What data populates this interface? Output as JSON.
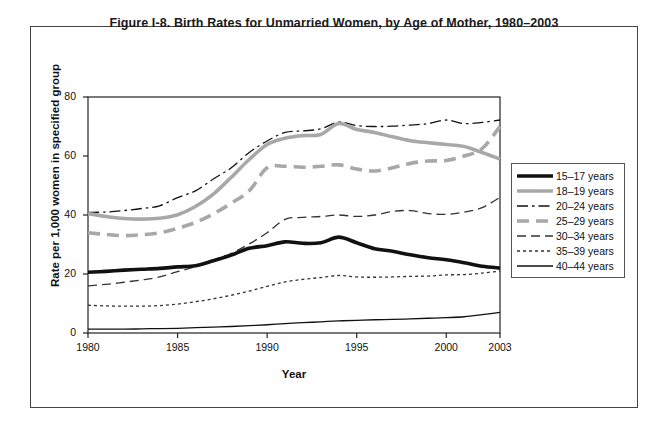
{
  "figure": {
    "title": "Figure I-8. Birth Rates for Unmarried Women, by Age of Mother, 1980–2003"
  },
  "chart_data": {
    "type": "line",
    "title": "Figure I-8. Birth Rates for Unmarried Women, by Age of Mother, 1980–2003",
    "xlabel": "Year",
    "ylabel": "Rate per 1,000 women in specified group",
    "xlim": [
      1980,
      2003
    ],
    "ylim": [
      0,
      80
    ],
    "yticks": [
      0,
      20,
      40,
      60,
      80
    ],
    "xticks": [
      1980,
      1985,
      1990,
      1995,
      2000,
      2003
    ],
    "grid": false,
    "legend_position": "right-outside",
    "x": [
      1980,
      1981,
      1982,
      1983,
      1984,
      1985,
      1986,
      1987,
      1988,
      1989,
      1990,
      1991,
      1992,
      1993,
      1994,
      1995,
      1996,
      1997,
      1998,
      1999,
      2000,
      2001,
      2002,
      2003
    ],
    "series": [
      {
        "name": "15–17 years",
        "style": "solid",
        "width": "thick",
        "color": "#111111",
        "values": [
          20.6,
          20.9,
          21.3,
          21.6,
          21.9,
          22.4,
          22.8,
          24.5,
          26.4,
          28.7,
          29.6,
          30.9,
          30.4,
          30.6,
          32.5,
          30.6,
          28.6,
          27.7,
          26.5,
          25.5,
          24.8,
          23.8,
          22.6,
          22.0
        ]
      },
      {
        "name": "18–19 years",
        "style": "solid",
        "width": "thick",
        "color": "#a8a8a8",
        "values": [
          40.5,
          39.5,
          38.8,
          38.6,
          38.9,
          40.1,
          42.9,
          47.1,
          52.8,
          58.8,
          63.9,
          66.0,
          66.9,
          67.3,
          71.0,
          69.0,
          68.0,
          66.5,
          65.2,
          64.5,
          63.9,
          63.2,
          61.2,
          59.0
        ]
      },
      {
        "name": "20–24 years",
        "style": "dash-dot",
        "width": "thin",
        "color": "#111111",
        "values": [
          40.9,
          41.0,
          41.5,
          42.2,
          43.1,
          45.9,
          48.2,
          52.2,
          56.0,
          61.2,
          65.1,
          68.0,
          68.5,
          69.2,
          71.5,
          70.3,
          70.0,
          70.1,
          70.5,
          71.0,
          72.2,
          71.0,
          71.4,
          72.2
        ]
      },
      {
        "name": "25–29 years",
        "style": "long-dash",
        "width": "thick",
        "color": "#a8a8a8",
        "values": [
          34.0,
          33.4,
          33.0,
          33.3,
          34.0,
          35.5,
          37.5,
          40.4,
          44.0,
          48.2,
          56.0,
          56.5,
          56.2,
          56.5,
          57.0,
          55.6,
          54.9,
          56.0,
          57.5,
          58.3,
          58.5,
          60.0,
          62.5,
          70.0
        ]
      },
      {
        "name": "30–34 years",
        "style": "dash",
        "width": "thin",
        "color": "#333333",
        "values": [
          16.0,
          16.5,
          17.2,
          18.0,
          19.0,
          20.8,
          22.5,
          24.8,
          27.0,
          30.2,
          34.0,
          38.5,
          39.2,
          39.5,
          40.0,
          39.5,
          40.0,
          41.2,
          41.5,
          40.5,
          40.2,
          41.0,
          42.5,
          46.0
        ]
      },
      {
        "name": "35–39 years",
        "style": "dotted",
        "width": "thin",
        "color": "#333333",
        "values": [
          9.4,
          9.2,
          9.1,
          9.1,
          9.3,
          9.8,
          10.6,
          11.6,
          12.8,
          14.2,
          15.8,
          17.3,
          18.2,
          18.8,
          19.5,
          19.0,
          18.9,
          19.0,
          19.2,
          19.3,
          19.7,
          19.8,
          20.3,
          21.0
        ]
      },
      {
        "name": "40–44 years",
        "style": "solid",
        "width": "thin",
        "color": "#111111",
        "values": [
          1.3,
          1.3,
          1.3,
          1.4,
          1.5,
          1.6,
          1.8,
          2.0,
          2.2,
          2.5,
          2.8,
          3.2,
          3.5,
          3.8,
          4.1,
          4.3,
          4.5,
          4.6,
          4.8,
          5.0,
          5.2,
          5.5,
          6.2,
          7.0
        ]
      }
    ]
  },
  "axes": {
    "y_title": "Rate per 1,000 women in specified group",
    "x_title": "Year",
    "y_ticks": [
      "0",
      "20",
      "40",
      "60",
      "80"
    ],
    "x_ticks": [
      "1980",
      "1985",
      "1990",
      "1995",
      "2000",
      "2003"
    ]
  },
  "legend": {
    "items": [
      {
        "label": "15–17 years"
      },
      {
        "label": "18–19 years"
      },
      {
        "label": "20–24 years"
      },
      {
        "label": "25–29 years"
      },
      {
        "label": "30–34 years"
      },
      {
        "label": "35–39 years"
      },
      {
        "label": "40–44 years"
      }
    ]
  }
}
